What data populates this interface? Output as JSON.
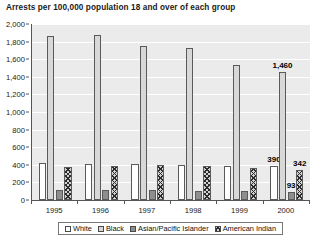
{
  "chart_data": {
    "type": "bar",
    "title": "Arrests per 100,000 population 18 and over of each group",
    "xlabel": "",
    "ylabel": "",
    "categories": [
      "1995",
      "1996",
      "1997",
      "1998",
      "1999",
      "2000"
    ],
    "ylim": [
      0,
      2000
    ],
    "yticks": [
      "0",
      "200",
      "400",
      "600",
      "800",
      "1,000",
      "1,200",
      "1,400",
      "1,600",
      "1,800",
      "2,000"
    ],
    "ytick_values": [
      0,
      200,
      400,
      600,
      800,
      1000,
      1200,
      1400,
      1600,
      1800,
      2000
    ],
    "grid": true,
    "grid_color": "#ffffff",
    "plot_background": "#ebebeb",
    "legend_position": "bottom",
    "series": [
      {
        "name": "White",
        "fill": "#ffffff",
        "pattern": "solid",
        "values": [
          420,
          408,
          404,
          398,
          385,
          390
        ],
        "labels": [
          "",
          "",
          "",
          "",
          "",
          "390"
        ]
      },
      {
        "name": "Black",
        "fill": "#d8d8d8",
        "pattern": "solid",
        "values": [
          1865,
          1880,
          1745,
          1730,
          1535,
          1460
        ],
        "labels": [
          "",
          "",
          "",
          "",
          "",
          "1,460"
        ]
      },
      {
        "name": "Asian/Pacific Islander",
        "fill": "#8e8e8e",
        "pattern": "solid",
        "values": [
          110,
          110,
          110,
          100,
          98,
          93
        ],
        "labels": [
          "",
          "",
          "",
          "",
          "",
          "93"
        ]
      },
      {
        "name": "American Indian",
        "fill": "#d2d2d2",
        "pattern": "crosshatch",
        "values": [
          372,
          385,
          400,
          392,
          365,
          342
        ],
        "labels": [
          "",
          "",
          "",
          "",
          "",
          "342"
        ]
      }
    ]
  }
}
